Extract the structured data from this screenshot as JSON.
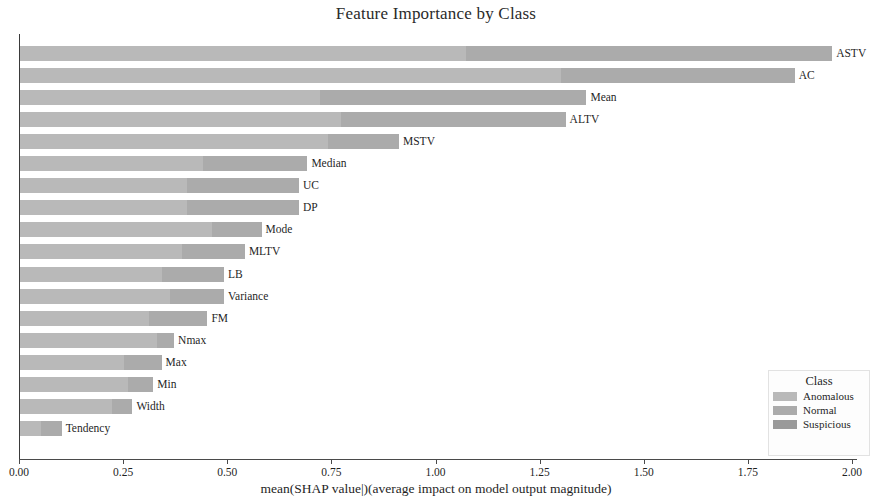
{
  "chart_data": {
    "type": "bar",
    "orientation": "horizontal",
    "stacked": true,
    "title": "Feature Importance by Class",
    "xlabel": "mean(SHAP value|)(average impact on model output magnitude)",
    "ylabel": "",
    "xlim": [
      0.0,
      2.0
    ],
    "xticks": [
      "0.00",
      "0.25",
      "0.50",
      "0.75",
      "1.00",
      "1.25",
      "1.50",
      "1.75",
      "2.00"
    ],
    "xtick_values": [
      0.0,
      0.25,
      0.5,
      0.75,
      1.0,
      1.25,
      1.5,
      1.75,
      2.0
    ],
    "grid": false,
    "legend": {
      "title": "Class",
      "position": "lower-right",
      "entries": [
        {
          "name": "Anomalous",
          "color": "#b9b9b9"
        },
        {
          "name": "Normal",
          "color": "#ababab"
        },
        {
          "name": "Suspicious",
          "color": "#9a9a9a"
        }
      ]
    },
    "categories": [
      "ASTV",
      "AC",
      "Mean",
      "ALTV",
      "MSTV",
      "Median",
      "UC",
      "DP",
      "Mode",
      "MLTV",
      "LB",
      "Variance",
      "FM",
      "Nmax",
      "Max",
      "Min",
      "Width",
      "Tendency"
    ],
    "series": [
      {
        "name": "Anomalous",
        "color": "#b9b9b9",
        "values": [
          1.07,
          1.3,
          0.72,
          0.77,
          0.74,
          0.44,
          0.4,
          0.4,
          0.46,
          0.39,
          0.34,
          0.36,
          0.31,
          0.33,
          0.25,
          0.26,
          0.22,
          0.05
        ]
      },
      {
        "name": "Normal",
        "color": "#ababab",
        "values": [
          0.88,
          0.56,
          0.64,
          0.54,
          0.17,
          0.25,
          0.27,
          0.27,
          0.12,
          0.15,
          0.15,
          0.13,
          0.14,
          0.04,
          0.09,
          0.06,
          0.05,
          0.05
        ]
      },
      {
        "name": "Suspicious",
        "color": "#9a9a9a",
        "values": [
          0.0,
          0.0,
          0.0,
          0.0,
          0.0,
          0.0,
          0.0,
          0.0,
          0.0,
          0.0,
          0.0,
          0.0,
          0.0,
          0.0,
          0.0,
          0.0,
          0.0,
          0.0
        ]
      }
    ],
    "totals": [
      1.95,
      1.86,
      1.36,
      1.31,
      0.91,
      0.69,
      0.67,
      0.67,
      0.58,
      0.54,
      0.49,
      0.49,
      0.45,
      0.37,
      0.34,
      0.32,
      0.27,
      0.1
    ]
  }
}
